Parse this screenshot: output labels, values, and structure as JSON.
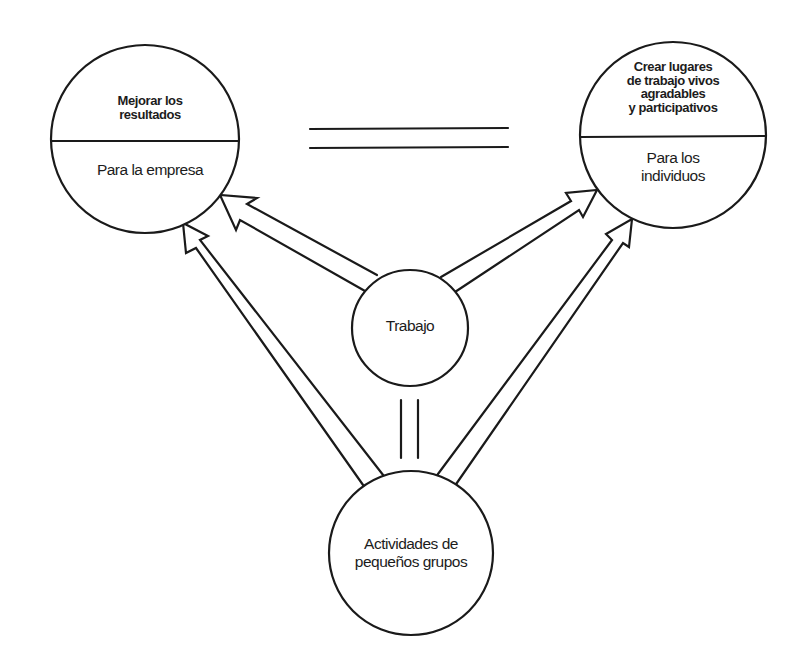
{
  "diagram": {
    "colors": {
      "stroke": "#1a1a1a",
      "background": "#ffffff",
      "text": "#1c1c1c"
    },
    "nodes": {
      "empresa": {
        "top_label": "Mejorar los resultados",
        "top_lines": [
          "Mejorar los",
          "resultados"
        ],
        "bottom_label": "Para la empresa"
      },
      "individuos": {
        "top_label": "Crear lugares de trabajo vivos agradables y participativos",
        "top_lines": [
          "Crear lugares",
          "de trabajo vivos",
          "agradables",
          "y participativos"
        ],
        "bottom_lines": [
          "Para los",
          "individuos"
        ]
      },
      "trabajo": {
        "label": "Trabajo"
      },
      "actividades": {
        "lines": [
          "Actividades de",
          "pequeños grupos"
        ]
      }
    },
    "relations": [
      {
        "from": "trabajo",
        "to": "empresa",
        "type": "arrow"
      },
      {
        "from": "trabajo",
        "to": "individuos",
        "type": "arrow"
      },
      {
        "from": "actividades",
        "to": "empresa",
        "type": "arrow"
      },
      {
        "from": "actividades",
        "to": "individuos",
        "type": "arrow"
      },
      {
        "from": "empresa",
        "to": "individuos",
        "type": "equals"
      },
      {
        "from": "trabajo",
        "to": "actividades",
        "type": "equals"
      }
    ]
  }
}
